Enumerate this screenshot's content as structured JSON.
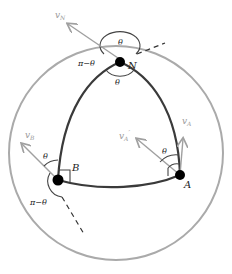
{
  "diagram": {
    "colors": {
      "sphere": "#a8a8a8",
      "triangle": "#3a3a3a",
      "vector": "#a0a0a0",
      "point": "#000000",
      "arc": "#444444"
    },
    "points": [
      {
        "id": "N",
        "label": "N"
      },
      {
        "id": "A",
        "label": "A"
      },
      {
        "id": "B",
        "label": "B"
      }
    ],
    "vectors": [
      {
        "id": "vN",
        "label": "v",
        "sub": "N"
      },
      {
        "id": "vA",
        "label": "v",
        "sub": "A"
      },
      {
        "id": "vA_prime",
        "label": "v",
        "sub": "A",
        "prime": "′"
      },
      {
        "id": "vB",
        "label": "v",
        "sub": "B"
      }
    ],
    "angles": {
      "theta": "θ",
      "pi_minus_theta": "π−θ"
    }
  }
}
